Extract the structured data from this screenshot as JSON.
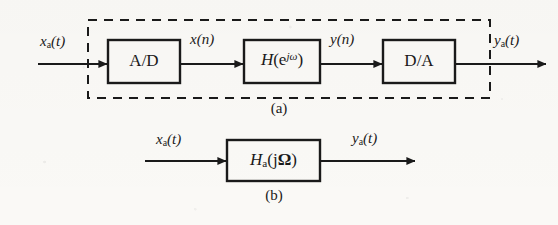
{
  "figure": {
    "background_color": "#faf9f6",
    "ink_color": "#1a1a1a",
    "type": "block-diagram"
  },
  "diagram_a": {
    "caption": "(a)",
    "enclosure": {
      "style": "dashed",
      "label": "discrete-time-system-boundary"
    },
    "input_label": {
      "base": "x",
      "sub": "a",
      "arg": "(t)"
    },
    "output_label": {
      "base": "y",
      "sub": "a",
      "arg": "(t)"
    },
    "blocks": [
      {
        "name": "ad-converter",
        "label": "A/D"
      },
      {
        "name": "digital-filter",
        "label_base": "H",
        "label_open": "(",
        "label_e": "e",
        "label_sup": "jω",
        "label_close": ")"
      },
      {
        "name": "da-converter",
        "label": "D/A"
      }
    ],
    "signals": [
      {
        "name": "x-of-n",
        "base": "x",
        "arg": "(n)"
      },
      {
        "name": "y-of-n",
        "base": "y",
        "arg": "(n)"
      }
    ]
  },
  "diagram_b": {
    "caption": "(b)",
    "input_label": {
      "base": "x",
      "sub": "a",
      "arg": "(t)"
    },
    "output_label": {
      "base": "y",
      "sub": "a",
      "arg": "(t)"
    },
    "block": {
      "name": "analog-filter",
      "label_base": "H",
      "label_sub": "a",
      "label_open": "(j",
      "label_omega": "Ω",
      "label_close": ")"
    }
  }
}
